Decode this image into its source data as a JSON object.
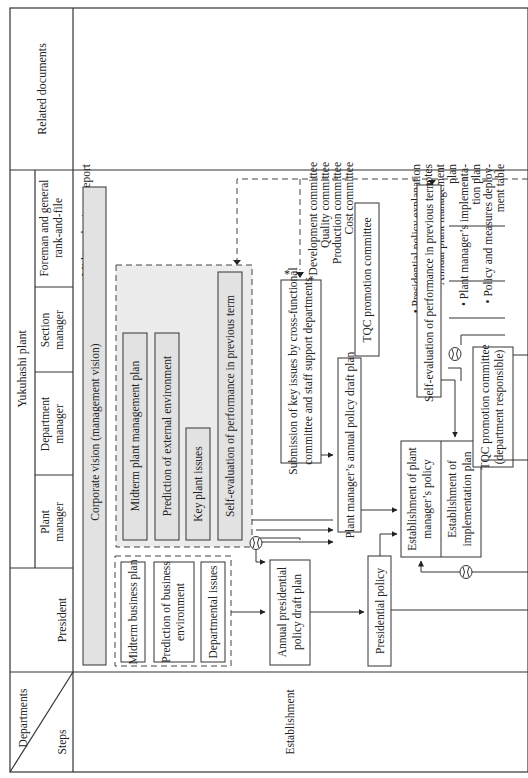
{
  "header": {
    "departments_label": "Departments",
    "steps_label": "Steps",
    "president": "President",
    "plant_group": "Yukuhashi plant",
    "plant_manager": [
      "Plant",
      "manager"
    ],
    "department_manager": [
      "Department",
      "manager"
    ],
    "section_manager": [
      "Section",
      "manager"
    ],
    "foreman": [
      "Foreman and general",
      "rank-and-file"
    ],
    "related_documents": "Related documents"
  },
  "steps": {
    "establishment": "Establishment"
  },
  "boxes": {
    "corporate_vision": "Corporate vision (management vision)",
    "president_inputs": [
      [
        "Midterm business plan"
      ],
      [
        "Prediction of business",
        "environment"
      ],
      [
        "Departmental issues"
      ]
    ],
    "plant_inputs": [
      "Midterm plant management plan",
      "Prediction of external environment",
      "Key plant issues",
      "Self-evaluation of performance in previous term"
    ],
    "annual_presidential_draft": [
      "Annual presidential",
      "policy draft plan"
    ],
    "submission_key_issues": [
      "Submission of key issues by cross-functional",
      "committee and staff support departments"
    ],
    "asterisk": "*",
    "plant_manager_draft": "Plant manager’s annual policy draft plan",
    "tqc_committee": "TQC promotion committee",
    "presidential_policy": "Presidential policy",
    "establish_plant_policy": [
      "Establishment of plant",
      "manager’s policy"
    ],
    "establish_impl_plan": [
      "Establishment of",
      "implementation plan"
    ],
    "tqc_committee_dept": [
      "TQC promotion committee",
      "(department responsible)"
    ],
    "self_eval_prev_term": "Self-evaluation of performance in previous term"
  },
  "related_documents": {
    "group1": [
      "Midterm business report"
    ],
    "committees": [
      "*Development committee",
      "Quality committee",
      "Production committee",
      "Cost committee"
    ],
    "group2": [
      [
        "Presidential policy explanation",
        "notes"
      ],
      [
        "Annual plant management",
        "plan"
      ],
      [
        "Plant manager’s implementa-",
        "tion plan"
      ],
      [
        "Policy and measures deploy-",
        "ment table"
      ]
    ]
  },
  "icons": {
    "meeting_symbol": "circle-with-arcs (meeting/review)"
  },
  "colors": {
    "line": "#333333",
    "shaded_fill": "#e2e2e2",
    "background": "#ffffff"
  }
}
